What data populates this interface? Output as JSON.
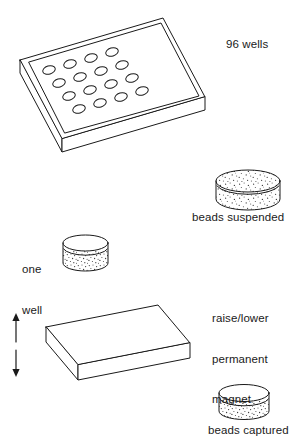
{
  "figure": {
    "background_color": "#ffffff",
    "stroke_color": "#1a1a1a",
    "speckle_color": "#3a3a3a"
  },
  "labels": {
    "wells_count": "96 wells",
    "beads_suspended": "beads suspended",
    "one_well_line1": "one",
    "one_well_line2": "well",
    "magnet_line1": "raise/lower",
    "magnet_line2": "permanent",
    "magnet_line3": "magnet",
    "beads_captured": "beads captured"
  },
  "microplate": {
    "well_rows": 4,
    "well_columns": 4,
    "total_wells_drawn": 16
  },
  "wells": {
    "suspended_state": "beads distributed throughout liquid",
    "captured_state": "beads settled at bottom of well"
  },
  "magnet": {
    "motion": "up-down",
    "arrow_up": "↑",
    "arrow_down": "↓"
  }
}
